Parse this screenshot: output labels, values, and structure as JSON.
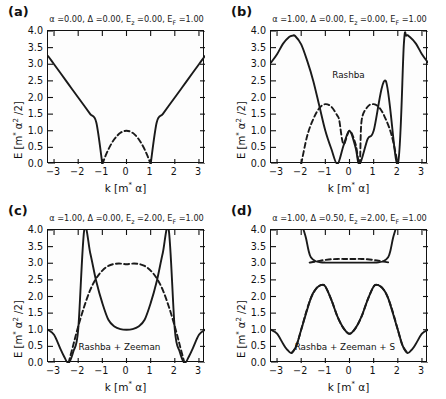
{
  "figure": {
    "width": 446,
    "height": 399,
    "background": "#ffffff",
    "panel_count": 4
  },
  "axis_common": {
    "xlabel": "k [m* α]",
    "ylabel": "E [m* α² /2]",
    "xlim": [
      -3.25,
      3.25
    ],
    "ylim": [
      0.0,
      4.0
    ],
    "xticks": [
      -3,
      -2,
      -1,
      0,
      1,
      2,
      3
    ],
    "xticklabels": [
      "−3",
      "−2",
      "−1",
      "0",
      "1",
      "2",
      "3"
    ],
    "yticks": [
      0.0,
      0.5,
      1.0,
      1.5,
      2.0,
      2.5,
      3.0,
      3.5,
      4.0
    ],
    "yticklabels": [
      "0.0",
      "0.5",
      "1.0",
      "1.5",
      "2.0",
      "2.5",
      "3.0",
      "3.5",
      "4.0"
    ],
    "grid": false,
    "legend": "none",
    "solid_color": "#1a1a1a",
    "dashed_color": "#1a1a1a"
  },
  "chart_data": [
    {
      "type": "line",
      "panel": "a",
      "tag": "(a)",
      "title": "α =0.00, Δ =0.00, E_z =0.00, E_F =1.00",
      "title_parts": {
        "alpha_label": "α",
        "alpha_value": "0.00",
        "delta_label": "Δ",
        "delta_value": "0.00",
        "ez_label": "E",
        "ez_sub": "z",
        "ez_value": "0.00",
        "ef_label": "E",
        "ef_sub": "F",
        "ef_value": "1.00"
      },
      "annotation": "",
      "xlabel": "k [m* α]",
      "ylabel": "E [m* α² /2]",
      "xlim": [
        -3.25,
        3.25
      ],
      "ylim": [
        0.0,
        4.0
      ],
      "series": [
        {
          "name": "outer-branch-solid",
          "style": "solid",
          "x": [
            -3.25,
            -3.0,
            -2.75,
            -2.5,
            -2.25,
            -2.0,
            -1.75,
            -1.5,
            -1.25,
            -1.0,
            -0.75,
            -0.5,
            -0.25,
            0.0,
            0.25,
            0.5,
            0.75,
            1.0,
            1.25,
            1.5,
            1.75,
            2.0,
            2.25,
            2.5,
            2.75,
            3.0,
            3.25
          ],
          "values": [
            3.25,
            3.0,
            2.75,
            2.5,
            2.25,
            2.0,
            1.75,
            1.5,
            1.25,
            0.0,
            null,
            null,
            null,
            null,
            null,
            null,
            null,
            0.0,
            1.25,
            1.5,
            1.75,
            2.0,
            2.25,
            2.5,
            2.75,
            3.0,
            3.25
          ]
        },
        {
          "name": "inner-branch-dashed",
          "style": "dashed",
          "x": [
            -1.0,
            -0.875,
            -0.75,
            -0.625,
            -0.5,
            -0.375,
            -0.25,
            -0.125,
            0.0,
            0.125,
            0.25,
            0.375,
            0.5,
            0.625,
            0.75,
            0.875,
            1.0
          ],
          "values": [
            0.0,
            0.234,
            0.438,
            0.609,
            0.75,
            0.859,
            0.938,
            0.984,
            1.0,
            0.984,
            0.938,
            0.859,
            0.75,
            0.609,
            0.438,
            0.234,
            0.0
          ]
        }
      ]
    },
    {
      "type": "line",
      "panel": "b",
      "tag": "(b)",
      "title": "α =1.00, Δ =0.00, E_z =0.00, E_F =1.00",
      "title_parts": {
        "alpha_label": "α",
        "alpha_value": "1.00",
        "delta_label": "Δ",
        "delta_value": "0.00",
        "ez_label": "E",
        "ez_sub": "z",
        "ez_value": "0.00",
        "ef_label": "E",
        "ef_sub": "F",
        "ef_value": "1.00"
      },
      "annotation": "Rashba",
      "annotation_xy": [
        0.0,
        2.62
      ],
      "xlabel": "k [m* α]",
      "ylabel": "E [m* α² /2]",
      "xlim": [
        -3.25,
        3.25
      ],
      "ylim": [
        0.0,
        4.0
      ],
      "series": [
        {
          "name": "branch-solid",
          "style": "solid",
          "comment": "|k^2+2k-1| style lobes: zeros near k=-2.0, -0.5, 0.42, 2.0; peaks ~3.85 at |k|~2.35; edge value 3.0 at |k|=3.2",
          "x": [
            -3.25,
            -3.0,
            -2.75,
            -2.5,
            -2.35,
            -2.25,
            -2.0,
            -1.75,
            -1.5,
            -1.25,
            -1.0,
            -0.75,
            -0.5,
            -0.25,
            0.0,
            0.25,
            0.42,
            0.75,
            1.0,
            1.5,
            2.0,
            2.25,
            2.35,
            2.5,
            2.75,
            3.0,
            3.25
          ],
          "values": [
            3.05,
            3.3,
            3.62,
            3.82,
            3.86,
            3.85,
            3.6,
            3.1,
            2.5,
            1.75,
            1.0,
            0.45,
            0.0,
            0.55,
            1.0,
            0.5,
            0.0,
            0.75,
            1.0,
            2.5,
            0.0,
            3.6,
            3.86,
            3.82,
            3.62,
            3.3,
            3.05
          ]
        },
        {
          "name": "branch-dashed",
          "style": "dashed",
          "comment": "companion branch, peaks 1.8 near k=+/-1.0, zeros at k=+/-2.0 and k=+/-0.42, crossing at k=0 value 1.0",
          "x": [
            -2.0,
            -1.75,
            -1.5,
            -1.25,
            -1.0,
            -0.75,
            -0.5,
            -0.42,
            -0.25,
            0.0,
            0.25,
            0.42,
            0.5,
            0.75,
            1.0,
            1.25,
            1.5,
            1.75,
            2.0
          ],
          "values": [
            0.0,
            0.85,
            1.35,
            1.68,
            1.8,
            1.72,
            1.45,
            1.3,
            0.6,
            1.0,
            0.6,
            0.0,
            1.3,
            1.72,
            1.8,
            1.68,
            1.35,
            0.85,
            0.0
          ]
        }
      ]
    },
    {
      "type": "line",
      "panel": "c",
      "tag": "(c)",
      "title": "α =1.00, Δ =0.00, E_z =2.00, E_F =1.00",
      "title_parts": {
        "alpha_label": "α",
        "alpha_value": "1.00",
        "delta_label": "Δ",
        "delta_value": "0.00",
        "ez_label": "E",
        "ez_sub": "z",
        "ez_value": "2.00",
        "ef_label": "E",
        "ef_sub": "F",
        "ef_value": "1.00"
      },
      "annotation": "Rashba + Zeeman",
      "annotation_xy": [
        -0.25,
        0.42
      ],
      "xlabel": "k [m* α]",
      "ylabel": "E [m* α² /2]",
      "xlim": [
        -3.25,
        3.25
      ],
      "ylim": [
        0.0,
        4.0
      ],
      "series": [
        {
          "name": "upper-branch-solid",
          "style": "solid",
          "comment": "central parabola min 1.0 at k=0, rising off-scale past |k|~1.75; plus small outer lobes zeroing at |k|=2.4 and returning to 1.0 at |k|=3.2",
          "x": [
            -3.25,
            -3.0,
            -2.75,
            -2.6,
            -2.4,
            -2.2,
            -2.0,
            -1.75,
            -1.5,
            -1.25,
            -1.0,
            -0.75,
            -0.5,
            -0.25,
            0.0,
            0.25,
            0.5,
            0.75,
            1.0,
            1.25,
            1.5,
            1.75,
            2.0,
            2.2,
            2.4,
            2.6,
            2.75,
            3.0,
            3.25
          ],
          "values": [
            1.0,
            0.85,
            0.45,
            0.22,
            0.0,
            0.35,
            1.0,
            4.0,
            3.3,
            2.45,
            1.8,
            1.3,
            1.1,
            1.02,
            1.0,
            1.02,
            1.1,
            1.3,
            1.8,
            2.45,
            3.3,
            4.0,
            1.0,
            0.35,
            0.0,
            0.22,
            0.45,
            0.85,
            1.0
          ]
        },
        {
          "name": "lower-branch-dashed",
          "style": "dashed",
          "comment": "broad dome peaking ~2.98 near k=-0.4 to +0.4, falling to 0 at |k|=2.4",
          "x": [
            -2.4,
            -2.2,
            -2.0,
            -1.75,
            -1.5,
            -1.25,
            -1.0,
            -0.75,
            -0.5,
            -0.25,
            0.0,
            0.25,
            0.5,
            0.75,
            1.0,
            1.25,
            1.5,
            1.75,
            2.0,
            2.2,
            2.4
          ],
          "values": [
            0.0,
            0.55,
            1.1,
            1.7,
            2.2,
            2.55,
            2.78,
            2.92,
            2.98,
            2.99,
            2.97,
            2.99,
            2.98,
            2.92,
            2.78,
            2.55,
            2.2,
            1.7,
            1.1,
            0.55,
            0.0
          ]
        }
      ]
    },
    {
      "type": "line",
      "panel": "d",
      "tag": "(d)",
      "title": "α =1.00, Δ =0.50, E_z =2.00, E_F =1.00",
      "title_parts": {
        "alpha_label": "α",
        "alpha_value": "1.00",
        "delta_label": "Δ",
        "delta_value": "0.50",
        "ez_label": "E",
        "ez_sub": "z",
        "ez_value": "2.00",
        "ef_label": "E",
        "ef_sub": "F",
        "ef_value": "1.00"
      },
      "annotation": "Rashba + Zeeman + S",
      "annotation_xy": [
        -0.15,
        0.42
      ],
      "xlabel": "k [m* α]",
      "ylabel": "E [m* α² /2]",
      "xlim": [
        -3.25,
        3.25
      ],
      "ylim": [
        0.0,
        4.0
      ],
      "series": [
        {
          "name": "upper-gapped-solid",
          "style": "solid",
          "comment": "upper band: flat shoulder ~3.05 between |k|~0.9 and 1.6, rising steeply outside to 4.0 near |k|~1.85",
          "x": [
            -1.9,
            -1.8,
            -1.7,
            -1.6,
            -1.4,
            -1.2,
            -1.0,
            -0.9,
            0.9,
            1.0,
            1.2,
            1.4,
            1.6,
            1.7,
            1.8,
            1.9
          ],
          "values": [
            4.0,
            3.75,
            3.4,
            3.18,
            3.06,
            3.03,
            3.02,
            3.02,
            3.02,
            3.02,
            3.03,
            3.06,
            3.18,
            3.4,
            3.75,
            4.0
          ]
        },
        {
          "name": "upper-gapped-dashed",
          "style": "dashed",
          "comment": "flat dashed segment at ~3.03-3.12 spanning k=-1.6 to +1.6",
          "x": [
            -1.65,
            -1.4,
            -1.2,
            -1.0,
            -0.75,
            -0.5,
            -0.25,
            0.0,
            0.25,
            0.5,
            0.75,
            1.0,
            1.2,
            1.4,
            1.65
          ],
          "values": [
            3.02,
            3.05,
            3.08,
            3.1,
            3.12,
            3.13,
            3.13,
            3.13,
            3.13,
            3.13,
            3.12,
            3.1,
            3.08,
            3.05,
            3.02
          ]
        },
        {
          "name": "lower-branch-solid",
          "style": "solid",
          "comment": "W shape: local min 0.88 at k=0, peaks 2.35 at |k|~1.15, outer lobes dip to 0.3 at |k|~2.4 then rise to 1.0 at |k|=3.2",
          "x": [
            -3.25,
            -3.0,
            -2.75,
            -2.6,
            -2.4,
            -2.2,
            -2.0,
            -1.6,
            -1.4,
            -1.25,
            -1.15,
            -1.0,
            -0.75,
            -0.5,
            -0.25,
            0.0,
            0.25,
            0.5,
            0.75,
            1.0,
            1.15,
            1.25,
            1.4,
            1.6,
            2.0,
            2.2,
            2.4,
            2.6,
            2.75,
            3.0,
            3.25
          ],
          "values": [
            1.0,
            0.88,
            0.58,
            0.42,
            0.3,
            0.52,
            1.0,
            1.95,
            2.22,
            2.32,
            2.35,
            2.3,
            1.9,
            1.4,
            1.05,
            0.88,
            1.05,
            1.4,
            1.9,
            2.3,
            2.35,
            2.32,
            2.22,
            1.95,
            1.0,
            0.52,
            0.3,
            0.42,
            0.58,
            0.88,
            1.0
          ]
        },
        {
          "name": "lower-branch-dashed",
          "style": "dashed",
          "comment": "mirror partner of lower solid band; dashed where the other spin dominates: from |k|~1.15 out to |k|~2.4 and across center",
          "x": [
            -2.4,
            -2.2,
            -2.0,
            -1.8,
            -1.6,
            -1.4,
            -1.25,
            -1.15,
            -1.0,
            -0.75,
            -0.5,
            -0.25,
            0.0,
            0.25,
            0.5,
            0.75,
            1.0,
            1.15,
            1.25,
            1.4,
            1.6,
            1.8,
            2.0,
            2.2,
            2.4
          ],
          "values": [
            0.3,
            0.52,
            1.0,
            1.52,
            1.95,
            2.22,
            2.32,
            2.35,
            2.3,
            1.9,
            1.4,
            1.05,
            0.88,
            1.05,
            1.4,
            1.9,
            2.3,
            2.35,
            2.32,
            2.22,
            1.95,
            1.52,
            1.0,
            0.52,
            0.3
          ]
        }
      ]
    }
  ]
}
